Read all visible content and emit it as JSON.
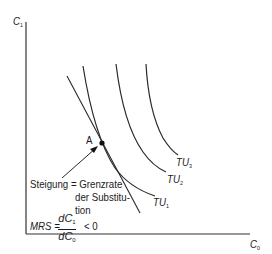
{
  "diagram": {
    "axes": {
      "y_label": "C",
      "y_label_sub": "1",
      "x_label": "C",
      "x_label_sub": "0"
    },
    "curves": [
      {
        "label": "TU",
        "sub": "1"
      },
      {
        "label": "TU",
        "sub": "2"
      },
      {
        "label": "TU",
        "sub": "3"
      }
    ],
    "point": {
      "label": "A"
    },
    "annotation": {
      "line1": "Steigung = Grenzrate",
      "line2": "der Substitu-",
      "line3": "tion"
    },
    "formula": {
      "lhs": "MRS =",
      "num": "dC",
      "num_sub": "1",
      "den": "dC",
      "den_sub": "0",
      "rhs": "< 0"
    },
    "colors": {
      "line": "#1a1a1a",
      "background": "#ffffff"
    }
  }
}
